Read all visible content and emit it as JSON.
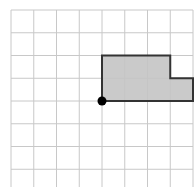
{
  "diagram": {
    "type": "grid-polygon",
    "grid": {
      "columns": 8,
      "rows": 8,
      "origin_px": [
        11,
        10
      ],
      "cell_px": 22.75,
      "line_color": "#c8c8c8"
    },
    "shape": {
      "vertices": [
        [
          4,
          2
        ],
        [
          7,
          2
        ],
        [
          7,
          3
        ],
        [
          8,
          3
        ],
        [
          8,
          4
        ],
        [
          4,
          4
        ]
      ],
      "fill": "#c4c4c4",
      "stroke": "#333333"
    },
    "point": {
      "at": [
        4,
        4
      ],
      "color": "#000000"
    }
  }
}
